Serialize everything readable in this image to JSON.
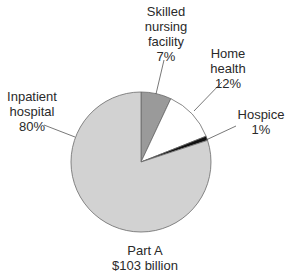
{
  "chart_data": {
    "type": "pie",
    "title": "Part A",
    "subtitle": "$103 billion",
    "start_angle_deg": 0,
    "direction": "clockwise",
    "slices": [
      {
        "label": "Skilled nursing facility",
        "label_lines": [
          "Skilled",
          "nursing",
          "facility"
        ],
        "value": 7,
        "value_label": "7%",
        "color": "#9a9a9a"
      },
      {
        "label": "Home health",
        "label_lines": [
          "Home",
          "health"
        ],
        "value": 12,
        "value_label": "12%",
        "color": "#ffffff"
      },
      {
        "label": "Hospice",
        "label_lines": [
          "Hospice"
        ],
        "value": 1,
        "value_label": "1%",
        "color": "#111111"
      },
      {
        "label": "Inpatient hospital",
        "label_lines": [
          "Inpatient",
          "hospital"
        ],
        "value": 80,
        "value_label": "80%",
        "color": "#d2d2d2"
      }
    ],
    "categories": [
      "Skilled nursing facility",
      "Home health",
      "Hospice",
      "Inpatient hospital"
    ],
    "values": [
      7,
      12,
      1,
      80
    ],
    "legend": "none (leader-line labels)"
  },
  "caption": {
    "line1": "Part A",
    "line2": "$103 billion"
  }
}
